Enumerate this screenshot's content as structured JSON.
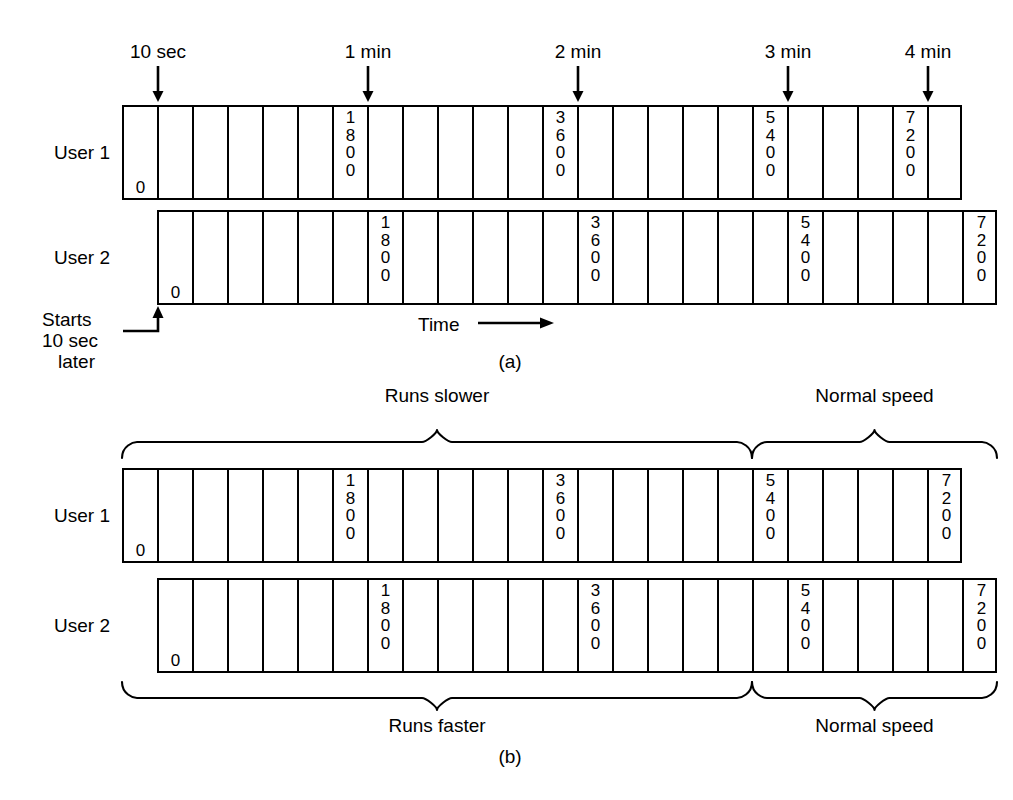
{
  "figure": {
    "caption_a": "(a)",
    "caption_b": "(b)",
    "time_label": "Time",
    "starts_later_line1": "Starts",
    "starts_later_line2": "10 sec",
    "starts_later_line3": "later"
  },
  "top_markers": [
    {
      "label": "10 sec",
      "x": 158
    },
    {
      "label": "1 min",
      "x": 368
    },
    {
      "label": "2 min",
      "x": 578
    },
    {
      "label": "3 min",
      "x": 788
    },
    {
      "label": "4 min",
      "x": 928
    }
  ],
  "part_a": {
    "rows": [
      {
        "name": "User 1",
        "label": "User 1",
        "offset_cells": 0,
        "cell_count": 24,
        "labels": {
          "0": "0",
          "6": "1800",
          "12": "3600",
          "18": "5400",
          "22": "7200"
        },
        "label_pos": {
          "0": "bottom",
          "6": "top",
          "12": "top",
          "18": "top",
          "22": "top"
        }
      },
      {
        "name": "User 2",
        "label": "User 2",
        "offset_cells": 1,
        "cell_count": 24,
        "labels": {
          "0": "0",
          "6": "1800",
          "12": "3600",
          "18": "5400",
          "23": "7200"
        },
        "label_pos": {
          "0": "bottom",
          "6": "top",
          "12": "top",
          "18": "top",
          "23": "top"
        }
      }
    ]
  },
  "part_b": {
    "top_braces": [
      {
        "label": "Runs slower",
        "start_cell": 0,
        "end_cell": 17
      },
      {
        "label": "Normal speed",
        "start_cell": 18,
        "end_cell": 24
      }
    ],
    "bottom_braces": [
      {
        "label": "Runs faster",
        "start_cell": 0,
        "end_cell": 17
      },
      {
        "label": "Normal speed",
        "start_cell": 18,
        "end_cell": 24
      }
    ],
    "rows": [
      {
        "name": "User 1",
        "label": "User 1",
        "offset_cells": 0,
        "cell_count": 24,
        "labels": {
          "0": "0",
          "6": "1800",
          "12": "3600",
          "18": "5400",
          "23": "7200"
        },
        "label_pos": {
          "0": "bottom",
          "6": "top",
          "12": "top",
          "18": "top",
          "23": "top"
        }
      },
      {
        "name": "User 2",
        "label": "User 2",
        "offset_cells": 1,
        "cell_count": 24,
        "labels": {
          "0": "0",
          "6": "1800",
          "12": "3600",
          "18": "5400",
          "23": "7200"
        },
        "label_pos": {
          "0": "bottom",
          "6": "top",
          "12": "top",
          "18": "top",
          "23": "top"
        }
      }
    ]
  },
  "colors": {
    "stroke": "#000000",
    "background": "#ffffff"
  }
}
